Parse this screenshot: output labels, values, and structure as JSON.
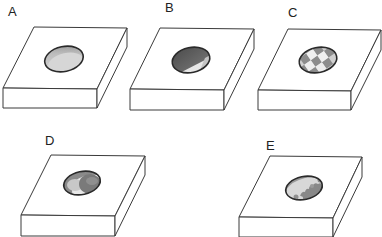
{
  "figure": {
    "panels": [
      {
        "id": "A",
        "label": "A",
        "pattern": "uniform",
        "pattern_desc": "uniform light grey fill"
      },
      {
        "id": "B",
        "label": "B",
        "pattern": "two-phase-diagonal",
        "pattern_desc": "dark grey upper-left, light lower-right, diagonal split"
      },
      {
        "id": "C",
        "label": "C",
        "pattern": "checkerboard",
        "pattern_desc": "checkered grey/white tiles"
      },
      {
        "id": "D",
        "label": "D",
        "pattern": "core-shell",
        "pattern_desc": "dark circular region on right over lighter crescent"
      },
      {
        "id": "E",
        "label": "E",
        "pattern": "irregular-domains",
        "pattern_desc": "irregular dark grey patches on light background"
      }
    ]
  },
  "colors": {
    "outline": "#3a3a3a",
    "well_light": "#d8d8d8",
    "well_mid": "#a8a8a8",
    "well_dark": "#6e6e6e",
    "background": "#ffffff"
  }
}
